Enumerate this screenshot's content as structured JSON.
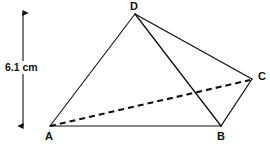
{
  "figure": {
    "background_color": "#ffffff",
    "stroke_color": "#111111",
    "canvas": {
      "width": 270,
      "height": 152
    },
    "vertices": [
      {
        "id": "A",
        "label": "A",
        "x": 50,
        "y": 126
      },
      {
        "id": "B",
        "label": "B",
        "x": 221,
        "y": 126
      },
      {
        "id": "C",
        "label": "C",
        "x": 252,
        "y": 79
      },
      {
        "id": "D",
        "label": "D",
        "x": 135,
        "y": 14
      }
    ],
    "edges": [
      {
        "from": "A",
        "to": "D",
        "style": "solid",
        "width": 1.1
      },
      {
        "from": "A",
        "to": "B",
        "style": "solid",
        "width": 1.1
      },
      {
        "from": "D",
        "to": "C",
        "style": "solid",
        "width": 1.3
      },
      {
        "from": "D",
        "to": "B",
        "style": "solid",
        "width": 1.3
      },
      {
        "from": "C",
        "to": "B",
        "style": "solid",
        "width": 1.3
      },
      {
        "from": "A",
        "to": "C",
        "style": "dashed",
        "width": 2.1,
        "dash": "6 4",
        "hidden_edge": true
      }
    ],
    "dimension": {
      "label": "6.1 cm",
      "value": 6.1,
      "unit": "cm",
      "orientation": "vertical",
      "x": 23,
      "y_top": 13,
      "y_bottom": 126,
      "arrowheads": "both"
    }
  }
}
